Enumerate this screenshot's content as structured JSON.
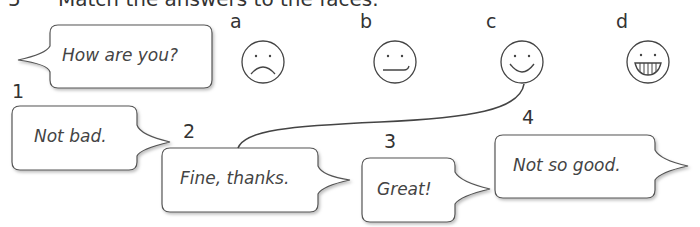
{
  "exercise": {
    "number": "5",
    "instruction": "Match the answers to the faces."
  },
  "question_bubble": {
    "text": "How are you?"
  },
  "faces": [
    {
      "label": "a",
      "expression": "sad"
    },
    {
      "label": "b",
      "expression": "neutral"
    },
    {
      "label": "c",
      "expression": "smiling"
    },
    {
      "label": "d",
      "expression": "grinning"
    }
  ],
  "answers": [
    {
      "number": "1",
      "text": "Not bad."
    },
    {
      "number": "2",
      "text": "Fine, thanks."
    },
    {
      "number": "3",
      "text": "Great!"
    },
    {
      "number": "4",
      "text": "Not so good."
    }
  ],
  "example_match": {
    "answer": "2",
    "face": "c"
  }
}
